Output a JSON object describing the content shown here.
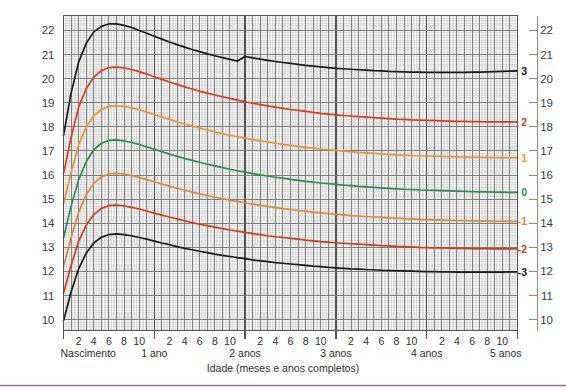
{
  "chart_data": {
    "type": "line",
    "title": "",
    "subtitle": "",
    "xlabel": "Idade (meses e anos completos)",
    "ylabel": "",
    "xlim": [
      0,
      60
    ],
    "ylim": [
      10,
      22.6
    ],
    "grid": true,
    "legend_position": "right-axis-labels",
    "y_ticks_left": [
      "10",
      "11",
      "12",
      "13",
      "14",
      "15",
      "16",
      "17",
      "18",
      "19",
      "20",
      "21",
      "22"
    ],
    "y_ticks_right": [
      "10",
      "11",
      "12",
      "13",
      "14",
      "15",
      "16",
      "17",
      "18",
      "19",
      "20",
      "21",
      "22"
    ],
    "x_year_labels": [
      "Nascimento",
      "1 ano",
      "2 anos",
      "3 anos",
      "4 anos",
      "5 anos"
    ],
    "x_year_months": [
      0,
      12,
      24,
      36,
      48,
      60
    ],
    "x_month_ticks": [
      2,
      4,
      6,
      8,
      10,
      14,
      16,
      18,
      20,
      22,
      26,
      28,
      30,
      32,
      34,
      38,
      40,
      42,
      44,
      46,
      50,
      52,
      54,
      56,
      58
    ],
    "x_month_labels": [
      "2",
      "4",
      "6",
      "8",
      "10",
      "2",
      "4",
      "6",
      "8",
      "10",
      "2",
      "4",
      "6",
      "8",
      "10",
      "2",
      "4",
      "6",
      "8",
      "10",
      "2",
      "4",
      "6",
      "8",
      "10"
    ],
    "discontinuity_month": 24,
    "x": [
      0,
      1,
      2,
      3,
      4,
      5,
      6,
      7,
      8,
      9,
      10,
      11,
      12,
      13,
      14,
      15,
      16,
      17,
      18,
      19,
      20,
      21,
      22,
      23,
      24,
      25,
      26,
      27,
      28,
      29,
      30,
      31,
      32,
      33,
      34,
      35,
      36,
      37,
      38,
      39,
      40,
      41,
      42,
      43,
      44,
      45,
      46,
      47,
      48,
      49,
      50,
      51,
      52,
      53,
      54,
      55,
      56,
      57,
      58,
      59,
      60
    ],
    "series": [
      {
        "name": "3",
        "label": "3",
        "color": "#1a1a1a",
        "values": [
          17.65,
          19.4,
          20.68,
          21.47,
          21.94,
          22.17,
          22.27,
          22.27,
          22.21,
          22.12,
          22.0,
          21.88,
          21.76,
          21.64,
          21.52,
          21.41,
          21.31,
          21.21,
          21.12,
          21.03,
          20.95,
          20.87,
          20.8,
          20.73,
          20.92,
          20.86,
          20.81,
          20.76,
          20.71,
          20.67,
          20.63,
          20.59,
          20.55,
          20.52,
          20.49,
          20.46,
          20.43,
          20.41,
          20.39,
          20.37,
          20.35,
          20.33,
          20.32,
          20.3,
          20.29,
          20.28,
          20.27,
          20.27,
          20.26,
          20.26,
          20.26,
          20.26,
          20.26,
          20.26,
          20.27,
          20.27,
          20.28,
          20.29,
          20.3,
          20.31,
          20.32
        ]
      },
      {
        "name": "2",
        "label": "2",
        "color": "#d93d1e",
        "values": [
          16.05,
          17.55,
          18.82,
          19.58,
          20.06,
          20.33,
          20.46,
          20.48,
          20.45,
          20.38,
          20.29,
          20.19,
          20.08,
          19.97,
          19.86,
          19.76,
          19.66,
          19.57,
          19.48,
          19.4,
          19.32,
          19.25,
          19.18,
          19.11,
          19.04,
          18.98,
          18.92,
          18.87,
          18.82,
          18.77,
          18.72,
          18.68,
          18.64,
          18.6,
          18.56,
          18.53,
          18.5,
          18.47,
          18.45,
          18.42,
          18.4,
          18.38,
          18.36,
          18.34,
          18.32,
          18.31,
          18.29,
          18.28,
          18.27,
          18.26,
          18.25,
          18.24,
          18.23,
          18.23,
          18.22,
          18.22,
          18.21,
          18.21,
          18.21,
          18.21,
          18.21
        ]
      },
      {
        "name": "1",
        "label": "1",
        "color": "#e8943a",
        "values": [
          14.8,
          16.1,
          17.26,
          17.99,
          18.46,
          18.72,
          18.85,
          18.88,
          18.85,
          18.79,
          18.71,
          18.61,
          18.51,
          18.41,
          18.31,
          18.21,
          18.12,
          18.03,
          17.95,
          17.87,
          17.79,
          17.72,
          17.65,
          17.59,
          17.53,
          17.47,
          17.42,
          17.37,
          17.32,
          17.27,
          17.23,
          17.19,
          17.15,
          17.12,
          17.08,
          17.05,
          17.02,
          16.99,
          16.97,
          16.94,
          16.92,
          16.9,
          16.88,
          16.86,
          16.84,
          16.83,
          16.81,
          16.8,
          16.79,
          16.78,
          16.77,
          16.76,
          16.75,
          16.74,
          16.74,
          16.73,
          16.73,
          16.72,
          16.72,
          16.72,
          16.72
        ]
      },
      {
        "name": "0",
        "label": "0",
        "color": "#2e8b4f",
        "values": [
          13.4,
          14.7,
          15.8,
          16.55,
          17.05,
          17.32,
          17.44,
          17.46,
          17.42,
          17.35,
          17.27,
          17.17,
          17.07,
          16.97,
          16.87,
          16.78,
          16.69,
          16.61,
          16.53,
          16.45,
          16.38,
          16.31,
          16.24,
          16.18,
          16.12,
          16.06,
          16.01,
          15.96,
          15.91,
          15.87,
          15.82,
          15.78,
          15.74,
          15.71,
          15.67,
          15.64,
          15.61,
          15.58,
          15.56,
          15.53,
          15.51,
          15.49,
          15.47,
          15.45,
          15.43,
          15.41,
          15.4,
          15.38,
          15.37,
          15.36,
          15.35,
          15.34,
          15.33,
          15.32,
          15.31,
          15.3,
          15.3,
          15.29,
          15.29,
          15.28,
          15.28
        ]
      },
      {
        "name": "-1",
        "label": "-1",
        "color": "#d98a3c",
        "values": [
          12.2,
          13.4,
          14.45,
          15.18,
          15.65,
          15.92,
          16.05,
          16.07,
          16.04,
          15.98,
          15.9,
          15.81,
          15.72,
          15.63,
          15.54,
          15.45,
          15.37,
          15.29,
          15.22,
          15.15,
          15.08,
          15.02,
          14.96,
          14.9,
          14.85,
          14.79,
          14.74,
          14.7,
          14.65,
          14.61,
          14.57,
          14.53,
          14.5,
          14.46,
          14.43,
          14.4,
          14.37,
          14.35,
          14.32,
          14.3,
          14.28,
          14.26,
          14.24,
          14.22,
          14.21,
          14.19,
          14.18,
          14.16,
          14.15,
          14.14,
          14.13,
          14.12,
          14.11,
          14.11,
          14.1,
          14.09,
          14.09,
          14.08,
          14.08,
          14.08,
          14.08
        ]
      },
      {
        "name": "-2",
        "label": "-2",
        "color": "#cc3b22",
        "values": [
          11.1,
          12.25,
          13.25,
          13.92,
          14.36,
          14.61,
          14.73,
          14.75,
          14.72,
          14.66,
          14.59,
          14.51,
          14.42,
          14.34,
          14.26,
          14.18,
          14.1,
          14.03,
          13.96,
          13.9,
          13.84,
          13.78,
          13.72,
          13.67,
          13.62,
          13.57,
          13.53,
          13.48,
          13.44,
          13.41,
          13.37,
          13.34,
          13.3,
          13.27,
          13.24,
          13.22,
          13.19,
          13.17,
          13.15,
          13.13,
          13.11,
          13.09,
          13.07,
          13.06,
          13.04,
          13.03,
          13.02,
          13.0,
          12.99,
          12.98,
          12.98,
          12.97,
          12.96,
          12.96,
          12.95,
          12.95,
          12.95,
          12.94,
          12.94,
          12.94,
          12.95
        ]
      },
      {
        "name": "-3",
        "label": "-3",
        "color": "#1a1a1a",
        "values": [
          9.95,
          11.15,
          12.11,
          12.76,
          13.18,
          13.42,
          13.53,
          13.56,
          13.53,
          13.48,
          13.41,
          13.34,
          13.26,
          13.18,
          13.11,
          13.03,
          12.96,
          12.9,
          12.84,
          12.78,
          12.72,
          12.67,
          12.62,
          12.57,
          12.53,
          12.48,
          12.44,
          12.41,
          12.37,
          12.34,
          12.31,
          12.28,
          12.25,
          12.22,
          12.2,
          12.17,
          12.15,
          12.13,
          12.11,
          12.1,
          12.08,
          12.07,
          12.05,
          12.04,
          12.03,
          12.02,
          12.01,
          12.0,
          11.99,
          11.99,
          11.98,
          11.98,
          11.97,
          11.97,
          11.97,
          11.97,
          11.97,
          11.97,
          11.97,
          11.98,
          11.98
        ]
      }
    ]
  },
  "colors": {
    "grid_minor": "#c9c9c9",
    "grid_major": "#6f6f6f",
    "axis": "#4a4a4a",
    "bottom_rule": "#9d6f94",
    "text": "#2e2e2e"
  }
}
